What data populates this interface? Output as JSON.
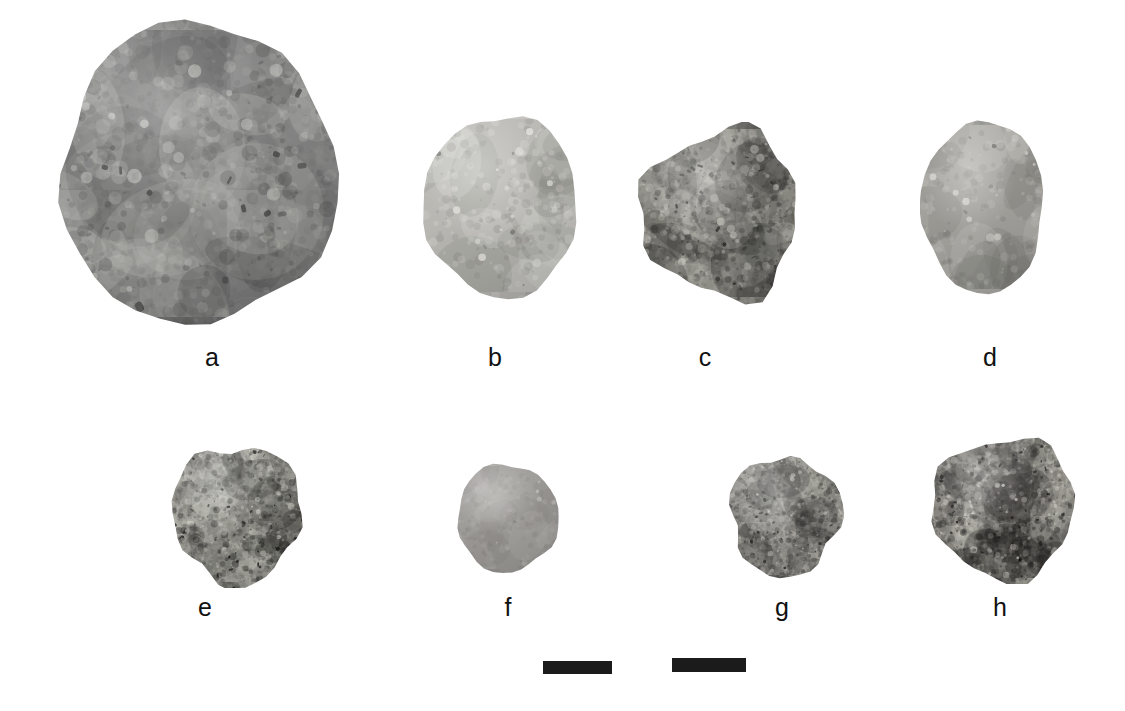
{
  "figure": {
    "background_color": "#ffffff",
    "width": 1125,
    "height": 711,
    "label_color": "#111111",
    "scalebar_color": "#1b1b1b",
    "rows": 2,
    "columns": 4
  },
  "specimens": [
    {
      "label": "a",
      "row": 1,
      "shape": "sphere",
      "x": 55,
      "y": 18,
      "w": 286,
      "h": 312,
      "label_x": 182,
      "label_y": 345,
      "tone": "mid-grey mottled",
      "base_color": "#9a9a9a",
      "light_color": "#dcdcd8",
      "dark_color": "#5a5a5a",
      "texture": "coarse-mottled",
      "speckle_density": 0.55,
      "contrast": 0.62
    },
    {
      "label": "b",
      "row": 1,
      "shape": "sphere",
      "x": 421,
      "y": 112,
      "w": 160,
      "h": 188,
      "label_x": 465,
      "label_y": 345,
      "tone": "light granular",
      "base_color": "#b8b7b2",
      "light_color": "#e6e5e0",
      "dark_color": "#7b7a76",
      "texture": "fine-granular",
      "speckle_density": 0.42,
      "contrast": 0.38
    },
    {
      "label": "c",
      "row": 1,
      "shape": "irregular-faceted",
      "x": 635,
      "y": 122,
      "w": 172,
      "h": 183,
      "label_x": 675,
      "label_y": 345,
      "tone": "rough pitted, dark left field",
      "base_color": "#a5a49e",
      "light_color": "#e2e1db",
      "dark_color": "#3a3a38",
      "texture": "pitted-rough",
      "speckle_density": 0.72,
      "contrast": 0.86
    },
    {
      "label": "d",
      "row": 1,
      "shape": "ovoid",
      "x": 920,
      "y": 118,
      "w": 126,
      "h": 178,
      "label_x": 960,
      "label_y": 345,
      "tone": "uniform grey ovoid with apex nub",
      "base_color": "#a3a29d",
      "light_color": "#d3d2cc",
      "dark_color": "#6e6d69",
      "texture": "fine-granular",
      "speckle_density": 0.4,
      "contrast": 0.34
    },
    {
      "label": "e",
      "row": 2,
      "shape": "rounded-irregular",
      "x": 168,
      "y": 440,
      "w": 138,
      "h": 148,
      "label_x": 175,
      "label_y": 595,
      "tone": "high-contrast speckled, dark patches",
      "base_color": "#b0afa9",
      "light_color": "#e8e7e1",
      "dark_color": "#232322",
      "texture": "speckled-inclusions",
      "speckle_density": 0.78,
      "contrast": 0.95
    },
    {
      "label": "f",
      "row": 2,
      "shape": "sphere",
      "x": 455,
      "y": 462,
      "w": 105,
      "h": 112,
      "label_x": 478,
      "label_y": 595,
      "tone": "smooth uniform medium grey",
      "base_color": "#9d9c98",
      "light_color": "#bfbeba",
      "dark_color": "#7a7975",
      "texture": "smooth-fine",
      "speckle_density": 0.22,
      "contrast": 0.2
    },
    {
      "label": "g",
      "row": 2,
      "shape": "rounded-irregular",
      "x": 726,
      "y": 452,
      "w": 118,
      "h": 128,
      "label_x": 752,
      "label_y": 595,
      "tone": "light with dark inclusions left",
      "base_color": "#b4b3ad",
      "light_color": "#e9e8e2",
      "dark_color": "#2e2e2c",
      "texture": "speckled-inclusions",
      "speckle_density": 0.7,
      "contrast": 0.88
    },
    {
      "label": "h",
      "row": 2,
      "shape": "rounded-irregular",
      "x": 928,
      "y": 432,
      "w": 152,
      "h": 152,
      "label_x": 970,
      "label_y": 595,
      "tone": "dense black speckling",
      "base_color": "#aeada7",
      "light_color": "#eceae4",
      "dark_color": "#201f1e",
      "texture": "dense-speckle",
      "speckle_density": 0.88,
      "contrast": 0.92
    }
  ],
  "scale_bars": [
    {
      "name": "scale-bar-left",
      "x": 543,
      "y": 661,
      "w": 69,
      "h": 13
    },
    {
      "name": "scale-bar-right",
      "x": 672,
      "y": 658,
      "w": 74,
      "h": 14
    }
  ]
}
